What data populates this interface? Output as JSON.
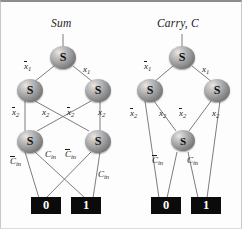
{
  "figure": {
    "type": "binary-decision-diagram",
    "node_glyph": "S",
    "colors": {
      "node_fill": "#8a8a8a",
      "terminal_fill": "#0b0b0b",
      "terminal_text": "#ffffff",
      "edge": "#6e6e6e",
      "text": "#1a1a1a",
      "background": "#fdfdfd"
    }
  },
  "diagrams": [
    {
      "id": "sum",
      "title": "Sum",
      "root_label": "S",
      "nodes": [
        {
          "id": "s_root",
          "label": "S",
          "level": 1
        },
        {
          "id": "s_l1",
          "label": "S",
          "level": 2
        },
        {
          "id": "s_r1",
          "label": "S",
          "level": 2
        },
        {
          "id": "s_l2",
          "label": "S",
          "level": 3
        },
        {
          "id": "s_r2",
          "label": "S",
          "level": 3
        }
      ],
      "edge_labels": {
        "root_left": "x̢1",
        "root_right": "x1",
        "l1_left": "x̢2",
        "l1_right": "x2",
        "r1_left": "x̢2",
        "r1_right": "x2",
        "l2_left": "C̄in",
        "l2_right": "Cin",
        "r2_left": "C̄in",
        "r2_right": "Cin"
      },
      "terminals": [
        {
          "id": "t0",
          "value": "0"
        },
        {
          "id": "t1",
          "value": "1"
        }
      ]
    },
    {
      "id": "carry",
      "title": "Carry, C",
      "root_label": "S",
      "nodes": [
        {
          "id": "c_root",
          "label": "S",
          "level": 1
        },
        {
          "id": "c_l1",
          "label": "S",
          "level": 2
        },
        {
          "id": "c_r1",
          "label": "S",
          "level": 2
        },
        {
          "id": "c_mid",
          "label": "S",
          "level": 3
        }
      ],
      "edge_labels": {
        "root_left": "x̢1",
        "root_right": "x1",
        "l1_left": "x̢2",
        "l1_right": "x2",
        "r1_left": "x̢2",
        "r1_right": "x2",
        "mid_left": "C̄in",
        "mid_right": "Cin"
      },
      "terminals": [
        {
          "id": "t0",
          "value": "0"
        },
        {
          "id": "t1",
          "value": "1"
        }
      ]
    }
  ],
  "labels": {
    "sum_title": "Sum",
    "carry_title": "Carry, C",
    "node_s": "S",
    "term_zero": "0",
    "term_one": "1",
    "x1": "x",
    "x1_sub": "1",
    "x2": "x",
    "x2_sub": "2",
    "cin": "C",
    "cin_sub": "in"
  }
}
